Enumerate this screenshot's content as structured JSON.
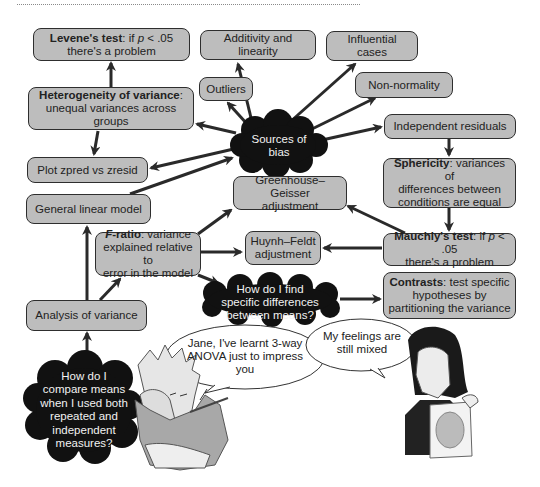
{
  "diagram": {
    "nodes": {
      "levene": {
        "bold": "Levene's test",
        "rest_a": ": if ",
        "italic": "p",
        "rest_b": " < .05",
        "line2": "there's a problem"
      },
      "additivity": {
        "label": "Additivity and linearity"
      },
      "influential": {
        "label": "Influential cases"
      },
      "non_normality": {
        "label": "Non-normality"
      },
      "outliers": {
        "label": "Outliers"
      },
      "heterogeneity": {
        "bold": "Heterogeneity of variance",
        "rest": ":",
        "line2": "unequal variances across groups"
      },
      "independent_residuals": {
        "label": "Independent residuals"
      },
      "plot_zpred": {
        "label": "Plot zpred vs zresid"
      },
      "sphericity": {
        "bold": "Sphericity",
        "rest": ": variances of",
        "line2": "differences between",
        "line3": "conditions are equal"
      },
      "greenhouse": {
        "line1": "Greenhouse–Geisser",
        "line2": "adjustment"
      },
      "glm": {
        "label": "General linear model"
      },
      "f_ratio": {
        "bold": "F",
        "bold2": "-ratio",
        "rest": ": variance",
        "line2": "explained relative to",
        "line3": "error in the model"
      },
      "huynh": {
        "line1": "Huynh–Feldt",
        "line2": "adjustment"
      },
      "mauchly": {
        "bold": "Mauchly's test",
        "rest_a": ": if ",
        "italic": "p",
        "rest_b": " < .05",
        "line2": "there's a problem"
      },
      "contrasts": {
        "bold": "Contrasts",
        "rest": ": test specific",
        "line2": "hypotheses by",
        "line3": "partitioning the variance"
      },
      "anova": {
        "label": "Analysis of variance"
      }
    },
    "clouds": {
      "sources_of_bias": {
        "line1": "Sources of",
        "line2": "bias"
      },
      "specific_differences": {
        "line1": "How do I find",
        "line2": "specific differences",
        "line3": "between means?"
      },
      "compare_means": {
        "line1": "How do I",
        "line2": "compare means",
        "line3": "when I used both",
        "line4": "repeated and",
        "line5": "independent",
        "line6": "measures?"
      }
    },
    "speech": {
      "left": {
        "line1": "Jane, I've learnt 3-way",
        "line2": "ANOVA just to impress",
        "line3": "you"
      },
      "right": {
        "line1": "My feelings are",
        "line2": "still mixed"
      }
    },
    "colors": {
      "box_fill": "#bdbdbd",
      "box_border": "#2e2e2e",
      "cloud_fill": "#111111",
      "arrow": "#2a2a2a"
    }
  }
}
